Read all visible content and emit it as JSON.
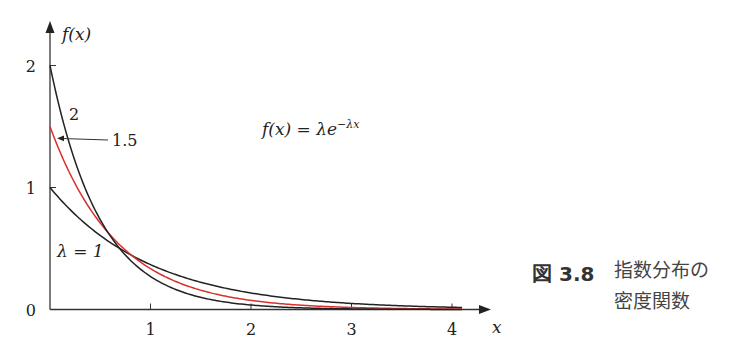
{
  "chart_data": {
    "type": "line",
    "title": "",
    "formula": "f(x) = λe^{-λx}",
    "formula_parts": {
      "lhs": "f(x) = λe",
      "exp": "−λx"
    },
    "ylabel": "f(x)",
    "xlabel": "x",
    "xlim": [
      0,
      4.3
    ],
    "ylim": [
      0,
      2.3
    ],
    "x_ticks": [
      1,
      2,
      3,
      4
    ],
    "x_tick_labels": [
      "1",
      "2",
      "3",
      "4"
    ],
    "y_ticks": [
      0,
      1,
      2
    ],
    "y_tick_labels": [
      "0",
      "1",
      "2"
    ],
    "grid": false,
    "x_range_plotted": [
      0,
      4.1
    ],
    "series": [
      {
        "name": "λ=1",
        "lambda": 1,
        "color": "#222222",
        "label": "λ = 1"
      },
      {
        "name": "λ=1.5",
        "lambda": 1.5,
        "color": "#d9302b",
        "label": "1.5"
      },
      {
        "name": "λ=2",
        "lambda": 2,
        "color": "#222222",
        "label": "2"
      }
    ]
  },
  "caption": {
    "figure_label": "図 3.8",
    "line1": "指数分布の",
    "line2": "密度関数"
  }
}
